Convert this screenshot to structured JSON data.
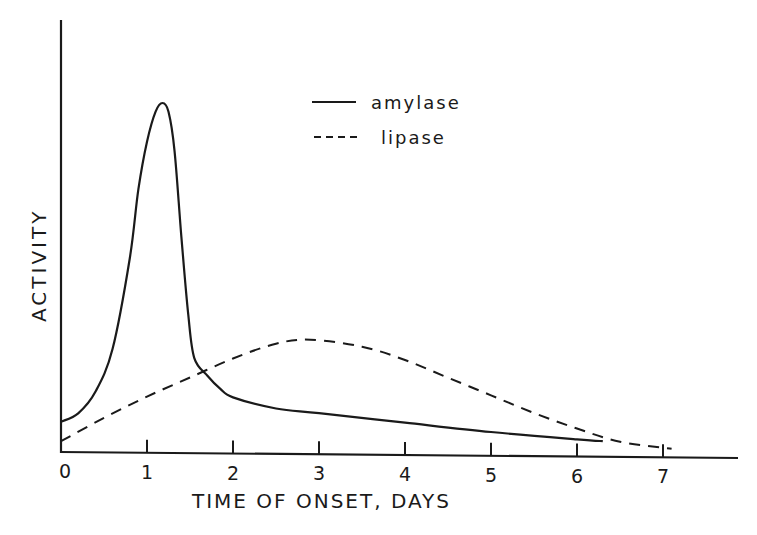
{
  "chart_data": {
    "type": "line",
    "title": "",
    "xlabel": "TIME OF ONSET, DAYS",
    "ylabel": "ACTIVITY",
    "x_ticks": [
      "0",
      "1",
      "2",
      "3",
      "4",
      "5",
      "6",
      "7"
    ],
    "xlim": [
      0,
      7.9
    ],
    "ylim": [
      0,
      100
    ],
    "y_units": "relative (no tick labels shown)",
    "grid": false,
    "legend": {
      "position": "upper center",
      "entries": [
        {
          "label": "amylase",
          "style": "solid"
        },
        {
          "label": "lipase",
          "style": "dashed"
        }
      ]
    },
    "series": [
      {
        "name": "amylase",
        "style": "solid",
        "points": [
          [
            0,
            7
          ],
          [
            0.2,
            9
          ],
          [
            0.4,
            14
          ],
          [
            0.6,
            24
          ],
          [
            0.8,
            45
          ],
          [
            0.9,
            61
          ],
          [
            1.0,
            72
          ],
          [
            1.1,
            79
          ],
          [
            1.18,
            81
          ],
          [
            1.25,
            79
          ],
          [
            1.32,
            70
          ],
          [
            1.4,
            50
          ],
          [
            1.48,
            32
          ],
          [
            1.55,
            22
          ],
          [
            1.7,
            18
          ],
          [
            1.85,
            15
          ],
          [
            2.0,
            13
          ],
          [
            2.5,
            10.5
          ],
          [
            3.0,
            9.5
          ],
          [
            4.0,
            7.5
          ],
          [
            5.0,
            5.5
          ],
          [
            6.0,
            4
          ],
          [
            6.3,
            3.6
          ]
        ]
      },
      {
        "name": "lipase",
        "style": "dashed",
        "points": [
          [
            0,
            2.5
          ],
          [
            0.5,
            8
          ],
          [
            1.0,
            13
          ],
          [
            1.5,
            17.5
          ],
          [
            2.0,
            22
          ],
          [
            2.5,
            25.5
          ],
          [
            2.9,
            26.5
          ],
          [
            3.5,
            25
          ],
          [
            4.0,
            22
          ],
          [
            4.5,
            18
          ],
          [
            5.0,
            14
          ],
          [
            5.5,
            10
          ],
          [
            6.0,
            6.5
          ],
          [
            6.5,
            3.5
          ],
          [
            7.1,
            2
          ]
        ]
      }
    ]
  }
}
